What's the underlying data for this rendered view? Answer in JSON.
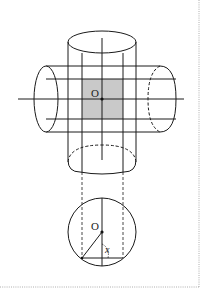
{
  "figure": {
    "labels": {
      "center_top": "O",
      "center_bottom": "O",
      "angle": "x"
    },
    "colors": {
      "stroke": "#1a1a1a",
      "shade": "#c8c8c8",
      "frame": "#888888",
      "background": "#ffffff"
    }
  }
}
